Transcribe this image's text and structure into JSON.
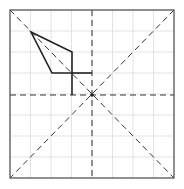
{
  "diagram": {
    "type": "folding-grid",
    "width": 184,
    "height": 189,
    "frame": {
      "x": 10,
      "y": 10,
      "width": 164,
      "height": 168,
      "stroke": "#555555"
    },
    "grid": {
      "cols": 8,
      "rows": 8,
      "stroke": "#dcdcdc"
    },
    "dashed_lines": [
      {
        "id": "vertical-center",
        "x1": 92,
        "y1": 10,
        "x2": 92,
        "y2": 178
      },
      {
        "id": "horizontal-center",
        "x1": 10,
        "y1": 95,
        "x2": 174,
        "y2": 95
      },
      {
        "id": "diagonal-main",
        "x1": 10,
        "y1": 10,
        "x2": 174,
        "y2": 178
      },
      {
        "id": "diagonal-anti",
        "x1": 174,
        "y1": 10,
        "x2": 10,
        "y2": 178
      }
    ],
    "dashed_stroke": "#333333",
    "shape": {
      "polygon": "31,32 72,52 72,73 52,73",
      "extra_segments": [
        {
          "x1": 72,
          "y1": 73,
          "x2": 92,
          "y2": 73
        },
        {
          "x1": 72,
          "y1": 73,
          "x2": 72,
          "y2": 95
        }
      ],
      "stroke": "#222222"
    },
    "center_point": {
      "x": 92,
      "y": 95,
      "r": 1.8,
      "fill": "#222222"
    }
  }
}
